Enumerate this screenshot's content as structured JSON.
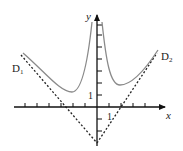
{
  "diagram": {
    "type": "function graph with asymptotes",
    "axes": {
      "x_label": "x",
      "y_label": "y",
      "unit_x_label": "1",
      "unit_y_label": "1"
    },
    "asymptotes": [
      {
        "name": "D1",
        "label_main": "D",
        "label_sub": "1",
        "style": "dashed"
      },
      {
        "name": "D2",
        "label_main": "D",
        "label_sub": "2",
        "style": "dashed"
      }
    ],
    "curve": {
      "color": "#8a8a8a",
      "branches": 2
    },
    "colors": {
      "axis": "#111111",
      "asymptote": "#222222",
      "curve": "#8a8a8a",
      "background": "#ffffff"
    }
  }
}
